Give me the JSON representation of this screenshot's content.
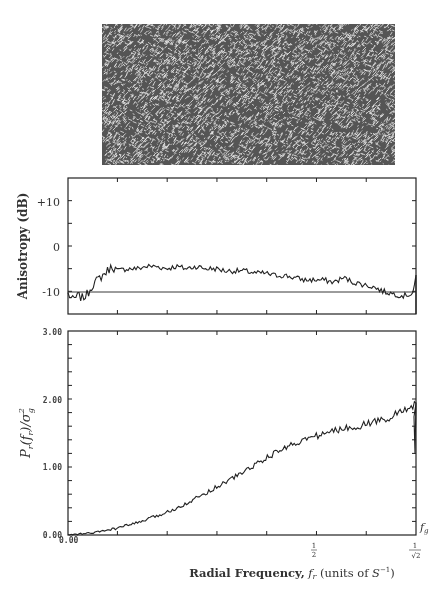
{
  "figure": {
    "top_image": {
      "description": "anisotropic random texture sample"
    },
    "anisotropy_plot": {
      "ylabel": "Anisotropy (dB)",
      "yticks": [
        "+10",
        "0",
        "-10"
      ]
    },
    "power_plot": {
      "ylabel": "P_r(f_r)/σ_g²",
      "yticks": [
        "3.00",
        "2.00",
        "1.00",
        "0.00"
      ],
      "x_origin_label": "0.00",
      "xticks": [
        "1/2",
        "1/√2"
      ],
      "annotation": "f_g",
      "xlabel": "Radial Frequency, f_r (units of S⁻¹)"
    }
  },
  "chart_data": [
    {
      "type": "line",
      "title": "",
      "xlabel": "",
      "ylabel": "Anisotropy (dB)",
      "ylim": [
        -15,
        15
      ],
      "xlim": [
        0,
        0.7071
      ],
      "reference_line": -10,
      "x": [
        0.0,
        0.01,
        0.02,
        0.03,
        0.04,
        0.05,
        0.06,
        0.07,
        0.08,
        0.09,
        0.1,
        0.12,
        0.14,
        0.16,
        0.18,
        0.2,
        0.22,
        0.24,
        0.26,
        0.28,
        0.3,
        0.32,
        0.34,
        0.36,
        0.38,
        0.4,
        0.42,
        0.44,
        0.46,
        0.48,
        0.5,
        0.52,
        0.54,
        0.56,
        0.58,
        0.6,
        0.62,
        0.64,
        0.66,
        0.68,
        0.7,
        0.707
      ],
      "values": [
        -10.5,
        -12,
        -11,
        -11.5,
        -10.5,
        -8.5,
        -7.5,
        -6.5,
        -5.5,
        -4.5,
        -5.5,
        -5,
        -5,
        -4.5,
        -4.5,
        -5,
        -4.5,
        -5,
        -4.5,
        -5,
        -5,
        -5.5,
        -5.5,
        -5.5,
        -6,
        -6,
        -6.5,
        -6.5,
        -7,
        -7.5,
        -7.5,
        -7.5,
        -8,
        -7,
        -8,
        -8.5,
        -9,
        -10,
        -10.5,
        -11,
        -10.5,
        -7
      ],
      "grid": false
    },
    {
      "type": "line",
      "title": "",
      "xlabel": "Radial Frequency, f_r (units of S⁻¹)",
      "ylabel": "P_r(f_r)/σ_g²",
      "ylim": [
        0,
        3
      ],
      "xlim": [
        0,
        0.7071
      ],
      "x": [
        0.0,
        0.05,
        0.1,
        0.15,
        0.2,
        0.25,
        0.3,
        0.35,
        0.4,
        0.45,
        0.5,
        0.55,
        0.6,
        0.65,
        0.68,
        0.7,
        0.707
      ],
      "values": [
        0.0,
        0.03,
        0.1,
        0.2,
        0.33,
        0.5,
        0.7,
        0.9,
        1.12,
        1.32,
        1.45,
        1.55,
        1.62,
        1.72,
        1.82,
        1.9,
        1.95
      ],
      "xtick_labels": [
        "0.00",
        "1/2",
        "1/√2"
      ],
      "ytick_labels": [
        "0.00",
        "1.00",
        "2.00",
        "3.00"
      ],
      "annotations": [
        "f_g"
      ],
      "grid": false
    }
  ]
}
